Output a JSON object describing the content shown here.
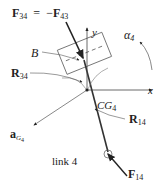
{
  "diagram": {
    "title": "link 4",
    "labels": {
      "f34_main": "F",
      "f34_sub": "34",
      "equals": "=",
      "minus": "−",
      "f43_main": "F",
      "f43_sub": "43",
      "point_b": "B",
      "r34_main": "R",
      "r34_sub": "34",
      "axis_y": "y",
      "axis_x": "x",
      "alpha_main": "α",
      "alpha_sub": "4",
      "cg_main": "CG",
      "cg_sub": "4",
      "ag_main": "a",
      "ag_sub_g": "G",
      "ag_sub_4": "4",
      "r14_main": "R",
      "r14_sub": "14",
      "f14_main": "F",
      "f14_sub": "14",
      "link_label": "link 4"
    },
    "colors": {
      "line": "#333333",
      "arrow": "#222222",
      "thin": "#555555",
      "text": "#222222"
    }
  }
}
